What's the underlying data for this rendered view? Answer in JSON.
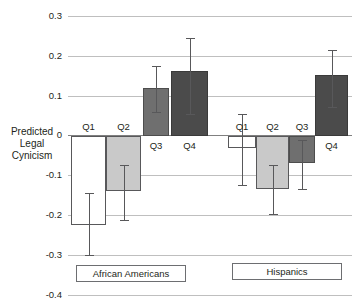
{
  "chart_data": {
    "type": "bar",
    "title": "",
    "subtitle": "",
    "xlabel": "",
    "ylabel": "Predicted Legal Cynicism",
    "ylabel_lines": [
      "Predicted",
      "Legal",
      "Cynicism"
    ],
    "ylim": [
      -0.4,
      0.3
    ],
    "ytick_labels": [
      "0.3",
      "0.2",
      "0.1",
      "0",
      "-0.1",
      "-0.2",
      "-0.3",
      "-0.4"
    ],
    "ytick_values": [
      0.3,
      0.2,
      0.1,
      0,
      -0.1,
      -0.2,
      -0.3,
      -0.4
    ],
    "grid": true,
    "grid_axis": "y",
    "legend": "none",
    "categories": [
      "Q1",
      "Q2",
      "Q3",
      "Q4"
    ],
    "groups": [
      {
        "name": "African Americans",
        "bars": [
          {
            "label": "Q1",
            "value": -0.225,
            "ci_low": -0.3,
            "ci_high": -0.145,
            "fill": "white"
          },
          {
            "label": "Q2",
            "value": -0.14,
            "ci_low": -0.212,
            "ci_high": -0.075,
            "fill": "light-gray"
          },
          {
            "label": "Q3",
            "value": 0.12,
            "ci_low": 0.06,
            "ci_high": 0.175,
            "fill": "medium-gray"
          },
          {
            "label": "Q4",
            "value": 0.162,
            "ci_low": 0.055,
            "ci_high": 0.245,
            "fill": "dark-gray"
          }
        ]
      },
      {
        "name": "Hispanics",
        "bars": [
          {
            "label": "Q1",
            "value": -0.03,
            "ci_low": -0.125,
            "ci_high": 0.055,
            "fill": "white"
          },
          {
            "label": "Q2",
            "value": -0.135,
            "ci_low": -0.196,
            "ci_high": -0.075,
            "fill": "light-gray"
          },
          {
            "label": "Q3",
            "value": -0.07,
            "ci_low": -0.135,
            "ci_high": -0.01,
            "fill": "medium-gray"
          },
          {
            "label": "Q4",
            "value": 0.152,
            "ci_low": 0.072,
            "ci_high": 0.215,
            "fill": "dark-gray"
          }
        ]
      }
    ],
    "colors": {
      "white": "#ffffff",
      "light_gray": "#c9c9c9",
      "medium_gray": "#6f6f6f",
      "dark_gray": "#4b4b4b",
      "bar_outline": "#58585a",
      "gridline": "#bfbfbf",
      "zero_line": "#808080",
      "text": "#231f20"
    }
  },
  "group_labels": {
    "african_americans": "African Americans",
    "hispanics": "Hispanics"
  }
}
